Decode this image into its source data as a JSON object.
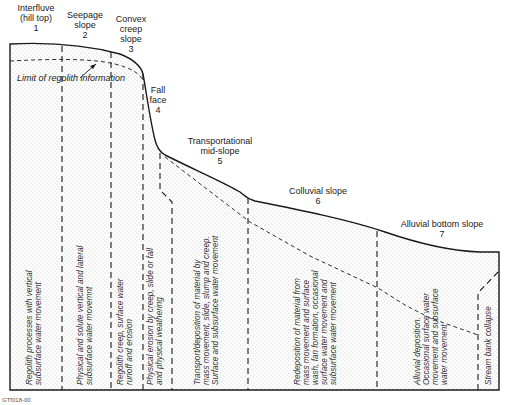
{
  "diagram": {
    "figure_code": "GTf018-00",
    "limit_label": "Limit of regolith information",
    "colors": {
      "line": "#1a1a1a",
      "fill_dots": "#b8b8b8",
      "background": "#ffffff"
    },
    "zones": [
      {
        "id": 1,
        "name_line1": "Interfluve",
        "name_line2": "(hill top)",
        "number": "1",
        "process_line1": "Regolith processes with vertical",
        "process_line2": "subsurface water movement"
      },
      {
        "id": 2,
        "name_line1": "Seepage",
        "name_line2": "slope",
        "number": "2",
        "process_line1": "Physical and solute vertical and lateral",
        "process_line2": "subsurface water movemnt"
      },
      {
        "id": 3,
        "name_line1": "Convex",
        "name_line2": "creep",
        "name_line3": "slope",
        "number": "3",
        "process_line1": "Regolith creep, surface water",
        "process_line2": "runoff and erosion"
      },
      {
        "id": 4,
        "name_line1": "Fall",
        "name_line2": "face",
        "number": "4",
        "process_line1": "Physical erosion by creep, slide or fall",
        "process_line2": "and physical weathering"
      },
      {
        "id": 5,
        "name_line1": "Transportational",
        "name_line2": "mid-slope",
        "number": "5",
        "process_line1": "Transport/deposition of material by",
        "process_line2": "mass movement, slide, slump and creep.",
        "process_line3": "Surface and subsurface water movement"
      },
      {
        "id": 6,
        "name_line1": "Colluvial slope",
        "number": "6",
        "process_line1": "Redeposition of material from",
        "process_line2": "mass movement and surface",
        "process_line3": "wash, fan formation, occasional",
        "process_line4": "surface water movement and",
        "process_line5": "subsurface water movement"
      },
      {
        "id": 7,
        "name_line1": "Alluvial bottom slope",
        "number": "7",
        "process_line1": "Alluvial deposition.",
        "process_line2": "Occasional surface water",
        "process_line3": "movement and subsurface",
        "process_line4": "water movement"
      }
    ],
    "stream_bank_label": "Stream bank collapse"
  }
}
